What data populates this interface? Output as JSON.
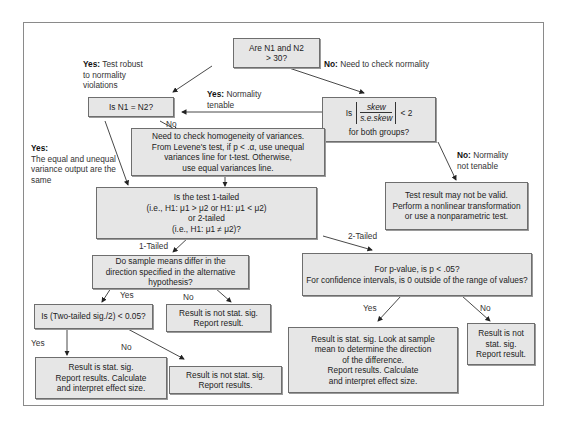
{
  "nodes": {
    "n_sizes": {
      "line1": "Are N1 and N2",
      "line2": "> 30?"
    },
    "equal_n": {
      "text": "Is N1 = N2?"
    },
    "skew": {
      "prefix": "Is",
      "numerator": "skew",
      "denominator": "s.e.skew",
      "suffix": "< 2",
      "line2": "for both groups?"
    },
    "levene": {
      "lines": [
        "Need to check homogeneity of variances.",
        "From Levene's test, if p < .α, use unequal",
        "variances line for t-test. Otherwise,",
        "use equal variances line."
      ]
    },
    "invalid": {
      "lines": [
        "Test result may not be valid.",
        "Perform a nonlinear transformation",
        "or use a nonparametric test."
      ]
    },
    "tails": {
      "lines": [
        "Is the test 1-tailed",
        "(i.e., H1: μ1 > μ2 or H1: μ1 < μ2)",
        "or 2-tailed",
        "(i.e., H1: μ1 ≠ μ2)?"
      ]
    },
    "direction": {
      "lines": [
        "Do sample means differ in the",
        "direction specified in the alternative",
        "hypothesis?"
      ]
    },
    "two_tailed_q": {
      "lines": [
        "For p-value, is p < .05?",
        "For confidence intervals, is 0 outside of the range of values?"
      ]
    },
    "half_sig": {
      "text": "Is (Two-tailed sig./2) < 0.05?"
    },
    "not_sig_1": {
      "lines": [
        "Result is not stat. sig.",
        "Report result."
      ]
    },
    "sig_1": {
      "lines": [
        "Result is stat. sig.",
        "Report results. Calculate",
        "and interpret effect size."
      ]
    },
    "not_sig_2": {
      "lines": [
        "Result is not stat. sig.",
        "Report results."
      ]
    },
    "sig_2": {
      "lines": [
        "Result is stat. sig. Look at sample",
        "mean to determine the direction",
        "of the difference.",
        "Report results. Calculate",
        "and interpret effect size."
      ]
    },
    "not_sig_3": {
      "lines": [
        "Result is not",
        "stat. sig.",
        "Report result."
      ]
    }
  },
  "labels": {
    "yes_robust": {
      "bold": "Yes:",
      "text": " Test robust",
      "line2": "to normality",
      "line3": "violations"
    },
    "no_check": {
      "bold": "No:",
      "text": " Need to check normality"
    },
    "yes_tenable": {
      "bold": "Yes:",
      "text": " Normality",
      "line2": "tenable"
    },
    "no_equal": "No",
    "yes_same": {
      "bold": "Yes:",
      "line2": "The equal and unequal",
      "line3": "variance output are the",
      "line4": "same"
    },
    "no_not_tenable": {
      "bold": "No:",
      "text": " Normality",
      "line2": "not tenable"
    },
    "one_tailed": "1-Tailed",
    "two_tailed": "2-Tailed",
    "yes_dir": "Yes",
    "no_dir": "No",
    "yes_half": "Yes",
    "no_half": "No",
    "yes_p": "Yes",
    "no_p": "No"
  }
}
